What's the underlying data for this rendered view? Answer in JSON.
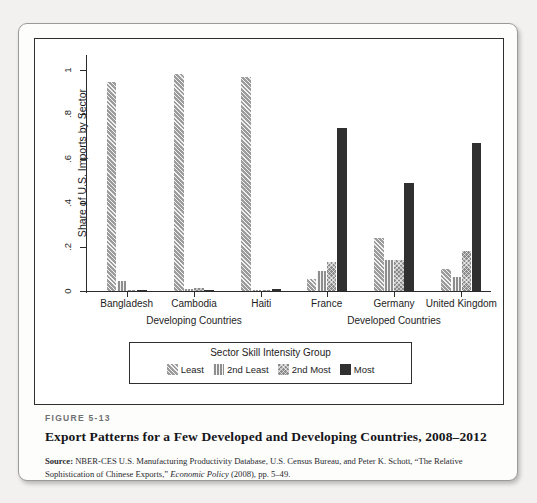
{
  "figure": {
    "number_label": "FIGURE 5-13",
    "title": "Export Patterns for a Few Developed and Developing Countries, 2008–2012",
    "source_lead": "Source:",
    "source_text_1": " NBER-CES U.S. Manufacturing Productivity Database, U.S. Census Bureau, and Peter K. Schott, “The Relative Sophistication of Chinese Exports,” ",
    "source_italic": "Economic Policy",
    "source_text_2": " (2008), pp. 5–49."
  },
  "legend": {
    "title": "Sector Skill Intensity Group",
    "items": [
      {
        "label": "Least",
        "pattern": "diagonal-hatch",
        "color": "#9c9c9c"
      },
      {
        "label": "2nd Least",
        "pattern": "vertical-lines",
        "color": "#8e8e8e"
      },
      {
        "label": "2nd Most",
        "pattern": "cross-hatch",
        "color": "#8a8a8a"
      },
      {
        "label": "Most",
        "pattern": "solid",
        "color": "#303030"
      }
    ]
  },
  "chart_data": {
    "type": "bar",
    "title": "Export Patterns for a Few Developed and Developing Countries, 2008–2012",
    "xlabel": "",
    "ylabel": "Share of U.S. Imports by Sector",
    "ylim": [
      0,
      1.06
    ],
    "yticks": [
      0,
      0.2,
      0.4,
      0.6,
      0.8,
      1
    ],
    "ytick_labels": [
      "0",
      ".2",
      ".4",
      ".6",
      ".8",
      "1"
    ],
    "grid": false,
    "legend_position": "below-axes",
    "categories": [
      "Bangladesh",
      "Cambodia",
      "Haiti",
      "France",
      "Germany",
      "United Kingdom"
    ],
    "group_labels": [
      {
        "label": "Developing Countries",
        "members": [
          "Bangladesh",
          "Cambodia",
          "Haiti"
        ]
      },
      {
        "label": "Developed Countries",
        "members": [
          "France",
          "Germany",
          "United Kingdom"
        ]
      }
    ],
    "series": [
      {
        "name": "Least",
        "values": [
          0.945,
          0.982,
          0.968,
          0.055,
          0.24,
          0.1
        ]
      },
      {
        "name": "2nd Least",
        "values": [
          0.045,
          0.008,
          0.004,
          0.09,
          0.14,
          0.065
        ]
      },
      {
        "name": "2nd Most",
        "values": [
          0.005,
          0.013,
          0.006,
          0.13,
          0.14,
          0.18
        ]
      },
      {
        "name": "Most",
        "values": [
          0.004,
          0.002,
          0.01,
          0.74,
          0.49,
          0.67
        ]
      }
    ]
  }
}
